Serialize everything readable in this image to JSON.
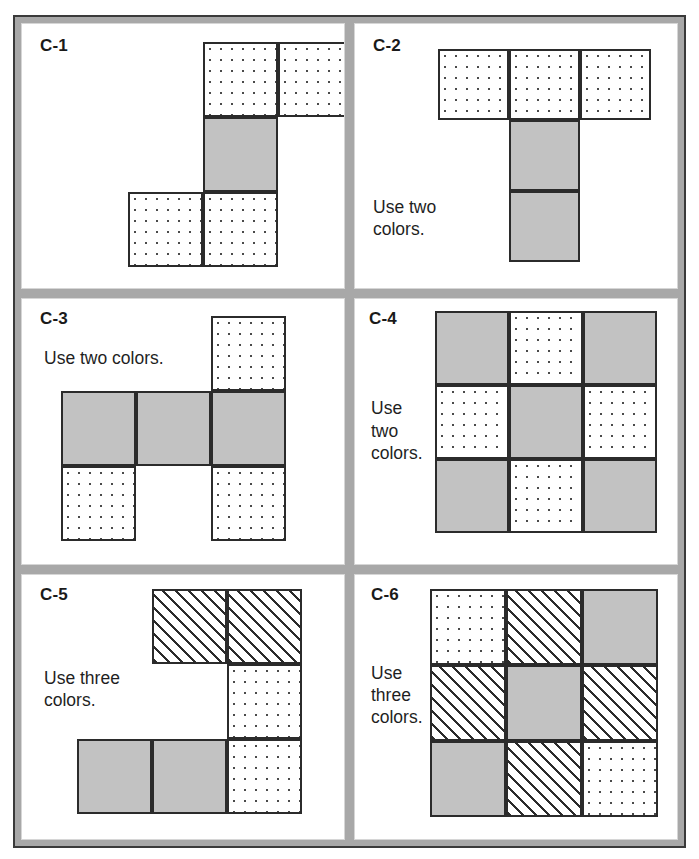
{
  "worksheet": {
    "frame_color": "#a8a8a8",
    "frame_border_color": "#3a3a3a",
    "page_background": "#ffffff"
  },
  "legend": {
    "fill_names": [
      "gray",
      "dotted",
      "hatched"
    ],
    "gray_color": "#c2c2c2",
    "outline_color": "#2b2b2b",
    "dot_color": "#4a4a4a"
  },
  "panels": [
    {
      "id": "C-1",
      "caption": "Use two\ncolors.",
      "label_pos": {
        "x": 18,
        "y": 12
      },
      "caption_pos": {
        "x": 193,
        "y": 145
      },
      "grid": {
        "x": 106,
        "y": 18,
        "cell": 75,
        "cols": 3,
        "rows": 3
      },
      "cells": [
        {
          "r": 0,
          "c": 1,
          "fill": "dotted"
        },
        {
          "r": 0,
          "c": 2,
          "fill": "dotted"
        },
        {
          "r": 1,
          "c": 1,
          "fill": "gray"
        },
        {
          "r": 2,
          "c": 0,
          "fill": "dotted"
        },
        {
          "r": 2,
          "c": 1,
          "fill": "dotted"
        }
      ]
    },
    {
      "id": "C-2",
      "caption": "Use two\ncolors.",
      "label_pos": {
        "x": 18,
        "y": 12
      },
      "caption_pos": {
        "x": 18,
        "y": 172
      },
      "grid": {
        "x": 83,
        "y": 25,
        "cell": 71,
        "cols": 3,
        "rows": 3
      },
      "cells": [
        {
          "r": 0,
          "c": 0,
          "fill": "dotted"
        },
        {
          "r": 0,
          "c": 1,
          "fill": "dotted"
        },
        {
          "r": 0,
          "c": 2,
          "fill": "dotted"
        },
        {
          "r": 1,
          "c": 1,
          "fill": "gray"
        },
        {
          "r": 2,
          "c": 1,
          "fill": "gray"
        }
      ]
    },
    {
      "id": "C-3",
      "caption": "Use two colors.",
      "label_pos": {
        "x": 18,
        "y": 10
      },
      "caption_pos": {
        "x": 22,
        "y": 48
      },
      "grid": {
        "x": 39,
        "y": 17,
        "cell": 75,
        "cols": 3,
        "rows": 3
      },
      "cells": [
        {
          "r": 0,
          "c": 2,
          "fill": "dotted"
        },
        {
          "r": 1,
          "c": 0,
          "fill": "gray"
        },
        {
          "r": 1,
          "c": 1,
          "fill": "gray"
        },
        {
          "r": 1,
          "c": 2,
          "fill": "gray"
        },
        {
          "r": 2,
          "c": 0,
          "fill": "dotted"
        },
        {
          "r": 2,
          "c": 2,
          "fill": "dotted"
        }
      ]
    },
    {
      "id": "C-4",
      "caption": "Use\ntwo\ncolors.",
      "label_pos": {
        "x": 14,
        "y": 10
      },
      "caption_pos": {
        "x": 16,
        "y": 98
      },
      "grid": {
        "x": 80,
        "y": 12,
        "cell": 74,
        "cols": 3,
        "rows": 3
      },
      "cells": [
        {
          "r": 0,
          "c": 0,
          "fill": "gray"
        },
        {
          "r": 0,
          "c": 1,
          "fill": "dotted"
        },
        {
          "r": 0,
          "c": 2,
          "fill": "gray"
        },
        {
          "r": 1,
          "c": 0,
          "fill": "dotted"
        },
        {
          "r": 1,
          "c": 1,
          "fill": "gray"
        },
        {
          "r": 1,
          "c": 2,
          "fill": "dotted"
        },
        {
          "r": 2,
          "c": 0,
          "fill": "gray"
        },
        {
          "r": 2,
          "c": 1,
          "fill": "dotted"
        },
        {
          "r": 2,
          "c": 2,
          "fill": "gray"
        }
      ]
    },
    {
      "id": "C-5",
      "caption": "Use three\ncolors.",
      "label_pos": {
        "x": 18,
        "y": 10
      },
      "caption_pos": {
        "x": 22,
        "y": 92
      },
      "grid": {
        "x": 55,
        "y": 14,
        "cell": 75,
        "cols": 3,
        "rows": 3
      },
      "cells": [
        {
          "r": 0,
          "c": 1,
          "fill": "hatched"
        },
        {
          "r": 0,
          "c": 2,
          "fill": "hatched"
        },
        {
          "r": 1,
          "c": 2,
          "fill": "dotted"
        },
        {
          "r": 2,
          "c": 0,
          "fill": "gray"
        },
        {
          "r": 2,
          "c": 1,
          "fill": "gray"
        },
        {
          "r": 2,
          "c": 2,
          "fill": "dotted"
        }
      ]
    },
    {
      "id": "C-6",
      "caption": "Use\nthree\ncolors.",
      "label_pos": {
        "x": 16,
        "y": 10
      },
      "caption_pos": {
        "x": 16,
        "y": 87
      },
      "grid": {
        "x": 75,
        "y": 14,
        "cell": 76,
        "cols": 3,
        "rows": 3
      },
      "cells": [
        {
          "r": 0,
          "c": 0,
          "fill": "dotted"
        },
        {
          "r": 0,
          "c": 1,
          "fill": "hatched"
        },
        {
          "r": 0,
          "c": 2,
          "fill": "gray"
        },
        {
          "r": 1,
          "c": 0,
          "fill": "hatched"
        },
        {
          "r": 1,
          "c": 1,
          "fill": "gray"
        },
        {
          "r": 1,
          "c": 2,
          "fill": "hatched"
        },
        {
          "r": 2,
          "c": 0,
          "fill": "gray"
        },
        {
          "r": 2,
          "c": 1,
          "fill": "hatched"
        },
        {
          "r": 2,
          "c": 2,
          "fill": "dotted"
        }
      ]
    }
  ]
}
